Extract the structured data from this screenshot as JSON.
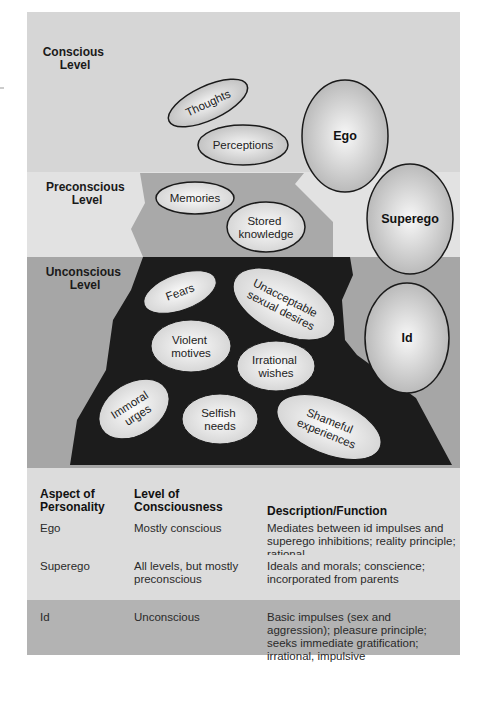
{
  "diagram": {
    "levels": [
      {
        "name": "conscious",
        "label_line1": "Conscious",
        "label_line2": "Level"
      },
      {
        "name": "preconscious",
        "label_line1": "Preconscious",
        "label_line2": "Level"
      },
      {
        "name": "unconscious",
        "label_line1": "Unconscious",
        "label_line2": "Level"
      }
    ],
    "conscious_contents": [
      {
        "label": "Thoughts"
      },
      {
        "label": "Perceptions"
      }
    ],
    "preconscious_contents": [
      {
        "label": "Memories"
      },
      {
        "label_line1": "Stored",
        "label_line2": "knowledge"
      }
    ],
    "unconscious_contents": [
      {
        "label": "Fears"
      },
      {
        "label_line1": "Unacceptable",
        "label_line2": "sexual desires"
      },
      {
        "label_line1": "Violent",
        "label_line2": "motives"
      },
      {
        "label_line1": "Irrational",
        "label_line2": "wishes"
      },
      {
        "label_line1": "Immoral",
        "label_line2": "urges"
      },
      {
        "label_line1": "Selfish",
        "label_line2": "needs"
      },
      {
        "label_line1": "Shameful",
        "label_line2": "experiences"
      }
    ],
    "structures": [
      {
        "label": "Ego"
      },
      {
        "label": "Superego"
      },
      {
        "label": "Id"
      }
    ],
    "colors": {
      "conscious_bg": "#d6d6d6",
      "preconscious_bg": "#e2e2e2",
      "preconscious_region": "#a9a9a9",
      "unconscious_bg": "#a6a6a6",
      "unconscious_region": "#1c1c1c",
      "bubble_outline": "#1a1a1a"
    }
  },
  "table": {
    "headers": {
      "aspect_line1": "Aspect of",
      "aspect_line2": "Personality",
      "level_line1": "Level of",
      "level_line2": "Consciousness",
      "description": "Description/Function"
    },
    "rows": [
      {
        "aspect": "Ego",
        "level": "Mostly conscious",
        "description": "Mediates between id impulses and superego inhibitions; reality principle; rational"
      },
      {
        "aspect": "Superego",
        "level": "All levels, but mostly preconscious",
        "description": "Ideals and morals; conscience; incorporated from parents"
      },
      {
        "aspect": "Id",
        "level": "Unconscious",
        "description": "Basic impulses (sex and aggression); pleasure principle; seeks immediate gratification; irrational, impulsive"
      }
    ]
  }
}
